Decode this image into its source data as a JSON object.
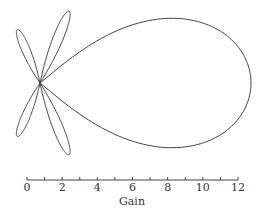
{
  "chart_data": {
    "type": "polar-line",
    "title": "",
    "xlabel": "Gain",
    "scale_bar": {
      "min": 0,
      "max": 12,
      "major_ticks": [
        0,
        2,
        4,
        6,
        8,
        10,
        12
      ],
      "minor_step": 1
    },
    "lobes": [
      {
        "name": "main lobe",
        "angle_deg": 0,
        "peak_gain": 12.0,
        "half_width_deg": 40
      },
      {
        "name": "side lobe 1",
        "angle_deg": 68,
        "peak_gain": 4.4,
        "half_width_deg": 10
      },
      {
        "name": "side lobe 2",
        "angle_deg": -68,
        "peak_gain": 4.4,
        "half_width_deg": 10
      },
      {
        "name": "side lobe 3",
        "angle_deg": 113,
        "peak_gain": 3.3,
        "half_width_deg": 11
      },
      {
        "name": "side lobe 4",
        "angle_deg": -113,
        "peak_gain": 3.3,
        "half_width_deg": 11
      }
    ],
    "grid": false,
    "legend": null
  },
  "axis": {
    "title": "Gain",
    "labels": [
      "0",
      "2",
      "4",
      "6",
      "8",
      "10",
      "12"
    ]
  }
}
